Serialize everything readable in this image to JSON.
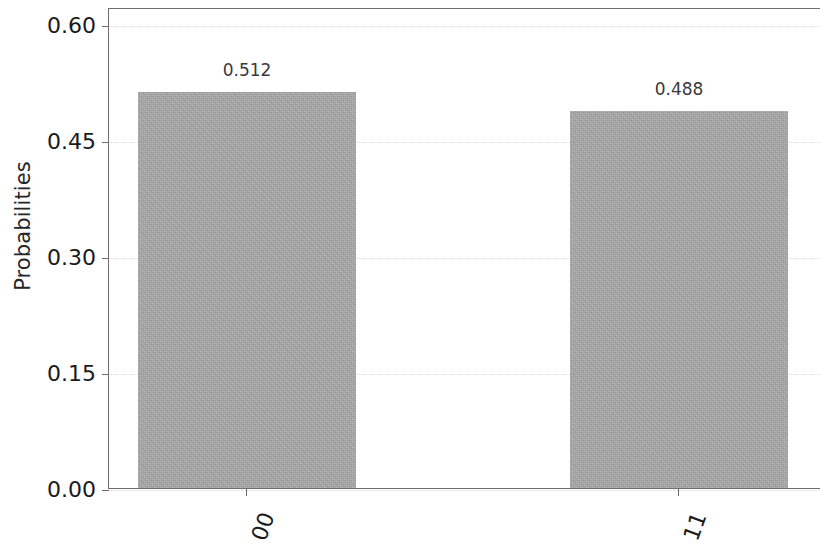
{
  "chart_data": {
    "type": "bar",
    "title": "",
    "xlabel": "",
    "ylabel": "Probabilities",
    "categories": [
      "00",
      "11"
    ],
    "values": [
      0.512,
      0.488
    ],
    "value_labels": [
      "0.512",
      "0.488"
    ],
    "ylim": [
      0.0,
      0.6225
    ],
    "yticks": [
      0.0,
      0.15,
      0.3,
      0.45,
      0.6
    ],
    "ytick_labels": [
      "0.00",
      "0.15",
      "0.30",
      "0.45",
      "0.60"
    ],
    "grid": "y-dotted",
    "legend": "none",
    "bar_color": "#a9a9a9",
    "axis_color": "#6e6e6e",
    "grid_color": "#dcdcdc",
    "text_color": "#1a1a1a",
    "value_label_color": "#3a3a3a",
    "xtick_rotation": -70
  }
}
